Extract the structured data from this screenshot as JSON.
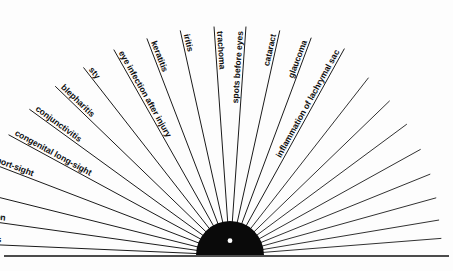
{
  "diagram": {
    "type": "fan-sunburst",
    "background_color": "#ffffff",
    "line_color": "#1b1b1b",
    "hub_color": "#0a0a0a",
    "hub_dot_color": "#ffffff",
    "center": {
      "x": 230,
      "y": 255
    },
    "hub_radius": 34,
    "hub_dot_radius": 2.4,
    "baseline": {
      "x1": 4,
      "y1": 256,
      "x2": 449,
      "y2": 256
    },
    "labeled_rays": [
      {
        "label": "refraction errors",
        "angle_deg": 177.5,
        "length": 300
      },
      {
        "label": "accomodation",
        "angle_deg": 172.0,
        "length": 290
      },
      {
        "label": "squint",
        "angle_deg": 166.0,
        "length": 275
      },
      {
        "label": "short-sight",
        "angle_deg": 159.0,
        "length": 262
      },
      {
        "label": "congenital long-sight",
        "angle_deg": 151.5,
        "length": 252
      },
      {
        "label": "conjunctivitis",
        "angle_deg": 144.0,
        "length": 248
      },
      {
        "label": "blepharitis",
        "angle_deg": 136.0,
        "length": 243
      },
      {
        "label": "sty",
        "angle_deg": 128.0,
        "length": 238
      },
      {
        "label": "eye infection after injury",
        "angle_deg": 119.5,
        "length": 236
      },
      {
        "label": "keratitis",
        "angle_deg": 111.0,
        "length": 232
      },
      {
        "label": "iritis",
        "angle_deg": 102.5,
        "length": 230
      },
      {
        "label": "trachoma",
        "angle_deg": 94.0,
        "length": 229
      },
      {
        "label": "spots before eyes",
        "angle_deg": 86.0,
        "length": 229
      },
      {
        "label": "cataract",
        "angle_deg": 77.5,
        "length": 230
      },
      {
        "label": "glaucoma",
        "angle_deg": 69.5,
        "length": 232
      },
      {
        "label": "inflammation of lachrymal sac",
        "angle_deg": 61.0,
        "length": 236
      }
    ],
    "unlabeled_rays": [
      {
        "angle_deg": 52.0,
        "length": 225
      },
      {
        "angle_deg": 44.0,
        "length": 222
      },
      {
        "angle_deg": 36.5,
        "length": 220
      },
      {
        "angle_deg": 29.0,
        "length": 218
      },
      {
        "angle_deg": 22.0,
        "length": 216
      },
      {
        "angle_deg": 15.5,
        "length": 214
      },
      {
        "angle_deg": 9.5,
        "length": 212
      },
      {
        "angle_deg": 4.5,
        "length": 212
      }
    ]
  }
}
